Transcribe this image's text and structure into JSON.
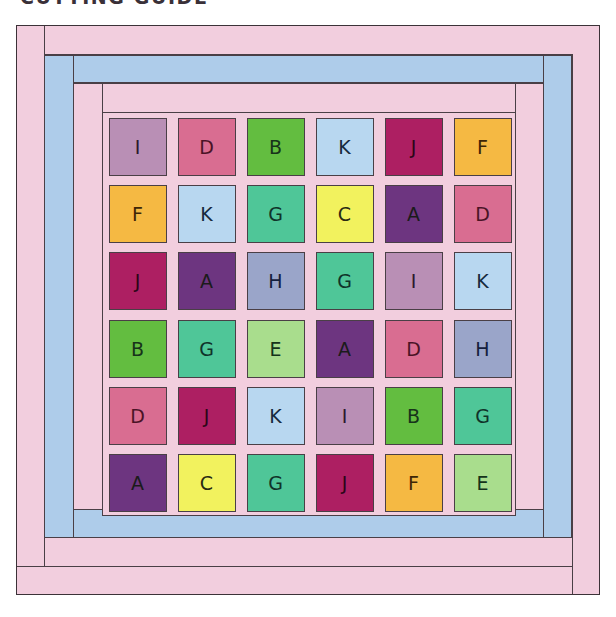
{
  "title": "CUTTING GUIDE",
  "colors": {
    "outer_border": "#f2cede",
    "middle_border": "#aeccea",
    "inner_border": "#f2cede",
    "sashing": "#f2cede",
    "seam_line": "#4a3f46",
    "page_background": "#ffffff",
    "title_text": "#3a3038"
  },
  "legend": {
    "A": {
      "fill": "#6d3580",
      "text": "#1b1b1b"
    },
    "B": {
      "fill": "#63bd40",
      "text": "#17331a"
    },
    "C": {
      "fill": "#f2f25e",
      "text": "#2a2a12"
    },
    "D": {
      "fill": "#d96d91",
      "text": "#4a1326"
    },
    "E": {
      "fill": "#a9dd8d",
      "text": "#14331a"
    },
    "F": {
      "fill": "#f5b943",
      "text": "#3d2606"
    },
    "G": {
      "fill": "#4fc698",
      "text": "#10332a"
    },
    "H": {
      "fill": "#9aa5c9",
      "text": "#15203d"
    },
    "I": {
      "fill": "#b98fb5",
      "text": "#2c1a2c"
    },
    "J": {
      "fill": "#ad1f62",
      "text": "#2c0618"
    },
    "K": {
      "fill": "#b8d7f0",
      "text": "#16293d"
    }
  },
  "grid": {
    "rows": 6,
    "columns": 6,
    "layout": [
      [
        "I",
        "D",
        "B",
        "K",
        "J",
        "F"
      ],
      [
        "F",
        "K",
        "G",
        "C",
        "A",
        "D"
      ],
      [
        "J",
        "A",
        "H",
        "G",
        "I",
        "K"
      ],
      [
        "B",
        "G",
        "E",
        "A",
        "D",
        "H"
      ],
      [
        "D",
        "J",
        "K",
        "I",
        "B",
        "G"
      ],
      [
        "A",
        "C",
        "G",
        "J",
        "F",
        "E"
      ]
    ]
  }
}
